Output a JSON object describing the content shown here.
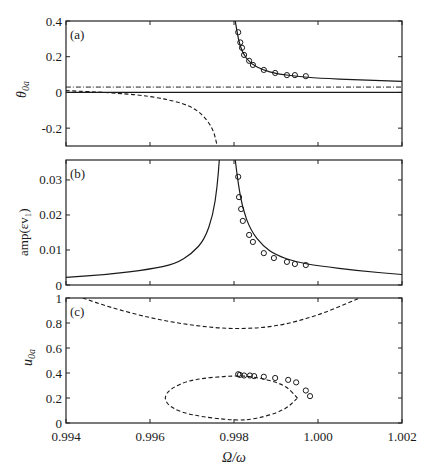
{
  "figure": {
    "xlabel": "Ω/ω",
    "x_ticks": [
      "0.994",
      "0.996",
      "0.998",
      "1.000",
      "1.002"
    ]
  },
  "panels": {
    "a": {
      "label": "(a)",
      "ylabel": "θ",
      "ylabel_sub": "0a",
      "y_ticks": [
        "0.4",
        "0.2",
        "0",
        "-0.2"
      ]
    },
    "b": {
      "label": "(b)",
      "ylabel": "amp(εv₁)",
      "y_ticks": [
        "0.03",
        "0.02",
        "0.01",
        "0"
      ]
    },
    "c": {
      "label": "(c)",
      "ylabel": "u",
      "ylabel_sub": "0a",
      "y_ticks": [
        "1",
        "0.8",
        "0.6",
        "0.4",
        "0.2",
        "0"
      ]
    }
  },
  "chart_data": [
    {
      "type": "line",
      "panel": "(a)",
      "title": "",
      "xlabel": "Ω/ω",
      "ylabel": "θ_0a",
      "xlim": [
        0.994,
        1.002
      ],
      "ylim": [
        -0.3,
        0.4
      ],
      "grid": false,
      "series": [
        {
          "name": "stable branch (solid, upper)",
          "style": "solid",
          "x": [
            0.99803,
            0.9981,
            0.9982,
            0.9984,
            0.9987,
            0.999,
            0.9995,
            1.0,
            1.001,
            1.002
          ],
          "y": [
            0.4,
            0.3,
            0.22,
            0.16,
            0.125,
            0.105,
            0.09,
            0.08,
            0.07,
            0.062
          ]
        },
        {
          "name": "lower branch (solid)",
          "style": "solid",
          "x": [
            0.994,
            1.002
          ],
          "y": [
            0.0,
            0.0
          ]
        },
        {
          "name": "unstable branch (dashed)",
          "style": "dashed",
          "x": [
            0.994,
            0.995,
            0.996,
            0.9968,
            0.9972,
            0.9975,
            0.9976
          ],
          "y": [
            0.01,
            0.0,
            -0.02,
            -0.06,
            -0.11,
            -0.2,
            -0.3
          ]
        },
        {
          "name": "reference (dash-dot)",
          "style": "dashdot",
          "x": [
            0.994,
            1.002
          ],
          "y": [
            0.03,
            0.03
          ]
        },
        {
          "name": "experiment (circles)",
          "style": "markers",
          "x": [
            0.9981,
            0.99815,
            0.99819,
            0.99824,
            0.99836,
            0.99845,
            0.99871,
            0.99898,
            0.99926,
            0.99945,
            0.99971
          ],
          "y": [
            0.337,
            0.28,
            0.25,
            0.21,
            0.177,
            0.154,
            0.126,
            0.109,
            0.097,
            0.097,
            0.091
          ]
        }
      ]
    },
    {
      "type": "line",
      "panel": "(b)",
      "title": "",
      "xlabel": "Ω/ω",
      "ylabel": "amp(εv₁)",
      "xlim": [
        0.994,
        1.002
      ],
      "ylim": [
        0,
        0.035
      ],
      "grid": false,
      "series": [
        {
          "name": "response left branch (solid)",
          "style": "solid",
          "x": [
            0.994,
            0.995,
            0.996,
            0.9966,
            0.997,
            0.9973,
            0.9975,
            0.9976,
            0.99765
          ],
          "y": [
            0.0022,
            0.003,
            0.0045,
            0.006,
            0.009,
            0.013,
            0.02,
            0.028,
            0.0357
          ]
        },
        {
          "name": "response right branch (solid)",
          "style": "solid",
          "x": [
            0.99803,
            0.9981,
            0.9982,
            0.9984,
            0.9987,
            0.999,
            0.9995,
            1.0,
            1.001,
            1.002
          ],
          "y": [
            0.0357,
            0.029,
            0.022,
            0.0155,
            0.011,
            0.0085,
            0.0065,
            0.0055,
            0.004,
            0.003
          ]
        },
        {
          "name": "experiment (circles)",
          "style": "markers",
          "x": [
            0.9981,
            0.99812,
            0.99817,
            0.99821,
            0.99836,
            0.99845,
            0.99871,
            0.99895,
            0.99926,
            0.99945,
            0.99971
          ],
          "y": [
            0.0309,
            0.0251,
            0.0217,
            0.0183,
            0.0143,
            0.0123,
            0.0091,
            0.0077,
            0.0066,
            0.006,
            0.0057
          ]
        }
      ]
    },
    {
      "type": "line",
      "panel": "(c)",
      "title": "",
      "xlabel": "Ω/ω",
      "ylabel": "u_0a",
      "xlim": [
        0.994,
        1.002
      ],
      "ylim": [
        0,
        1
      ],
      "grid": false,
      "series": [
        {
          "name": "upper arc (dashed)",
          "style": "dashed",
          "x": [
            0.9944,
            0.995,
            0.996,
            0.997,
            0.998,
            0.999,
            1.0,
            1.001
          ],
          "y": [
            1.0,
            0.93,
            0.84,
            0.78,
            0.75,
            0.77,
            0.86,
            1.0
          ]
        },
        {
          "name": "closed loop (dashed)",
          "style": "dashed",
          "x": [
            0.99951,
            0.9992,
            0.9985,
            0.998,
            0.997,
            0.9965,
            0.99632,
            0.9965,
            0.997,
            0.998,
            0.9985,
            0.9992,
            0.99951
          ],
          "y": [
            0.2,
            0.31,
            0.37,
            0.38,
            0.35,
            0.28,
            0.2,
            0.12,
            0.06,
            0.02,
            0.03,
            0.1,
            0.2
          ]
        },
        {
          "name": "experiment (circles)",
          "style": "markers",
          "x": [
            0.9981,
            0.99814,
            0.99824,
            0.99838,
            0.99848,
            0.99871,
            0.99898,
            0.99929,
            0.99948,
            0.99971,
            0.99981
          ],
          "y": [
            0.39,
            0.385,
            0.38,
            0.38,
            0.375,
            0.37,
            0.36,
            0.345,
            0.325,
            0.26,
            0.215
          ]
        }
      ]
    }
  ]
}
